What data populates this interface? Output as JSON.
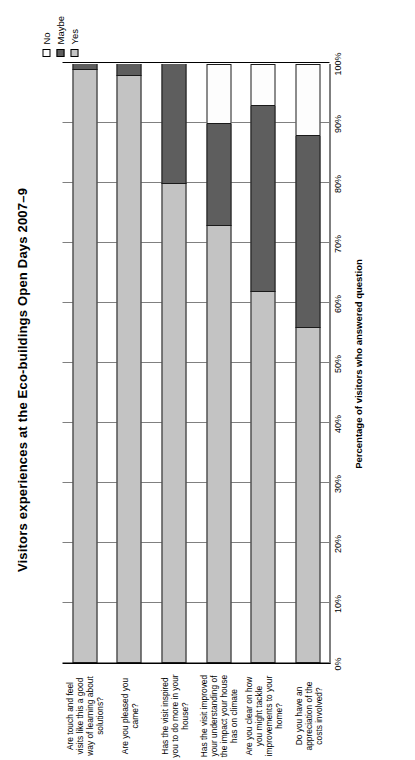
{
  "chart_data": {
    "type": "bar",
    "orientation": "horizontal-stacked",
    "title": "Visitors experiences at the Eco-buildings Open Days 2007–9",
    "xlabel": "Percentage of visitors who answered question",
    "ylabel": "",
    "xlim": [
      0,
      100
    ],
    "grid": true,
    "legend_position": "top-right",
    "tick_labels": [
      "0%",
      "10%",
      "20%",
      "30%",
      "40%",
      "50%",
      "60%",
      "70%",
      "80%",
      "90%",
      "100%"
    ],
    "tick_values": [
      0,
      10,
      20,
      30,
      40,
      50,
      60,
      70,
      80,
      90,
      100
    ],
    "categories": [
      "Are touch and feel visits like this a good way of learning about solutions?",
      "Are you pleased you came?",
      "Has the visit inspired you to do more in your house?",
      "Has the visit improved your understanding of the impact your house has on climate",
      "Are you clear on how you might tackle improvements to your home?",
      "Do you have an appreciation of the costs involved?"
    ],
    "series": [
      {
        "name": "Yes",
        "color": "#c3c3c3",
        "values": [
          99,
          98,
          80,
          73,
          62,
          56
        ]
      },
      {
        "name": "Maybe",
        "color": "#5e5e5e",
        "values": [
          1,
          2,
          20,
          17,
          31,
          32
        ]
      },
      {
        "name": "No",
        "color": "#fdfdfd",
        "values": [
          0,
          0,
          0,
          10,
          7,
          12
        ]
      }
    ]
  },
  "legend": {
    "items": [
      {
        "label": "No"
      },
      {
        "label": "Maybe"
      },
      {
        "label": "Yes"
      }
    ]
  }
}
